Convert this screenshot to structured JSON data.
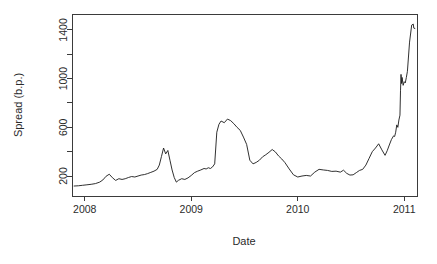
{
  "chart_data": {
    "type": "line",
    "title": "",
    "xlabel": "Date",
    "ylabel": "Spread (b.p.)",
    "xlim": [
      2007.88,
      2011.12
    ],
    "ylim": [
      36,
      1531
    ],
    "grid": false,
    "legend": null,
    "x_tick_labels": [
      "2008",
      "2009",
      "2010",
      "2011"
    ],
    "x_tick_values": [
      2008,
      2009,
      2010,
      2011
    ],
    "y_tick_labels": [
      "200",
      "600",
      "1000",
      "1400"
    ],
    "y_tick_values": [
      200,
      600,
      1000,
      1400
    ],
    "y_minor_ticks": [
      400,
      800,
      1200
    ],
    "series": [
      {
        "name": "Spread",
        "color": "#1a1a1a",
        "x": [
          2007.9,
          2007.94,
          2007.98,
          2008.02,
          2008.06,
          2008.1,
          2008.14,
          2008.17,
          2008.2,
          2008.23,
          2008.26,
          2008.29,
          2008.32,
          2008.35,
          2008.38,
          2008.41,
          2008.44,
          2008.47,
          2008.5,
          2008.53,
          2008.56,
          2008.59,
          2008.62,
          2008.65,
          2008.68,
          2008.7,
          2008.72,
          2008.74,
          2008.76,
          2008.78,
          2008.8,
          2008.82,
          2008.84,
          2008.86,
          2008.88,
          2008.91,
          2008.94,
          2008.97,
          2009.0,
          2009.03,
          2009.06,
          2009.09,
          2009.12,
          2009.14,
          2009.16,
          2009.18,
          2009.2,
          2009.22,
          2009.24,
          2009.26,
          2009.28,
          2009.31,
          2009.34,
          2009.37,
          2009.4,
          2009.43,
          2009.46,
          2009.49,
          2009.52,
          2009.55,
          2009.58,
          2009.61,
          2009.64,
          2009.67,
          2009.7,
          2009.73,
          2009.76,
          2009.79,
          2009.82,
          2009.85,
          2009.88,
          2009.92,
          2009.96,
          2010.0,
          2010.04,
          2010.08,
          2010.12,
          2010.16,
          2010.2,
          2010.24,
          2010.28,
          2010.32,
          2010.36,
          2010.4,
          2010.43,
          2010.46,
          2010.49,
          2010.52,
          2010.55,
          2010.58,
          2010.61,
          2010.64,
          2010.67,
          2010.7,
          2010.73,
          2010.76,
          2010.79,
          2010.82,
          2010.84,
          2010.86,
          2010.88,
          2010.9,
          2010.91,
          2010.92,
          2010.93,
          2010.94,
          2010.95,
          2010.96,
          2010.965,
          2010.97,
          2010.975,
          2010.98,
          2010.99,
          2011.0,
          2011.01,
          2011.02,
          2011.03,
          2011.05,
          2011.07,
          2011.085,
          2011.09,
          2011.1
        ],
        "y": [
          118,
          120,
          124,
          128,
          132,
          138,
          150,
          168,
          198,
          215,
          186,
          164,
          178,
          172,
          178,
          188,
          196,
          192,
          200,
          208,
          212,
          220,
          230,
          240,
          255,
          290,
          360,
          430,
          382,
          410,
          330,
          250,
          188,
          150,
          165,
          178,
          172,
          185,
          205,
          228,
          240,
          250,
          262,
          258,
          268,
          262,
          275,
          300,
          560,
          625,
          652,
          638,
          668,
          655,
          630,
          600,
          575,
          520,
          460,
          330,
          300,
          312,
          330,
          358,
          375,
          395,
          418,
          398,
          365,
          340,
          310,
          258,
          210,
          192,
          200,
          205,
          200,
          232,
          255,
          250,
          246,
          238,
          240,
          232,
          248,
          222,
          208,
          210,
          228,
          246,
          255,
          290,
          345,
          400,
          430,
          465,
          415,
          370,
          408,
          455,
          500,
          530,
          525,
          560,
          620,
          600,
          660,
          700,
          900,
          1035,
          960,
          1010,
          945,
          975,
          965,
          1010,
          1060,
          1300,
          1440,
          1448,
          1415,
          1412
        ]
      }
    ]
  }
}
